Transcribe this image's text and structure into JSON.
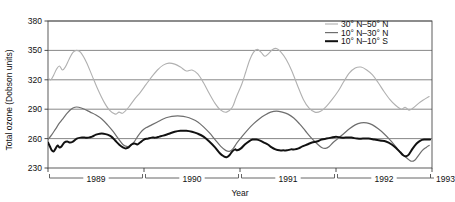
{
  "chart_data": {
    "type": "line",
    "title": "",
    "xlabel": "Year",
    "ylabel": "Total ozone (Dobson units)",
    "ylim": [
      230,
      380
    ],
    "xlim": [
      1989,
      1993
    ],
    "yticks": [
      230,
      260,
      290,
      320,
      350,
      380
    ],
    "xticks": [
      1989,
      1990,
      1991,
      1992,
      1993
    ],
    "xtick_labels": [
      "1989",
      "1990",
      "1991",
      "1992",
      "1993"
    ],
    "ytick_labels": [
      "230",
      "260",
      "290",
      "320",
      "350",
      "380"
    ],
    "grid": "horizontal",
    "legend_position": "top-right",
    "series": [
      {
        "name": "30° N–50° N",
        "color": "#b0b0b0",
        "width": 1.1,
        "points": [
          [
            1989.0,
            322
          ],
          [
            1989.03,
            320
          ],
          [
            1989.06,
            325
          ],
          [
            1989.09,
            331
          ],
          [
            1989.12,
            334
          ],
          [
            1989.15,
            330
          ],
          [
            1989.18,
            333
          ],
          [
            1989.22,
            341
          ],
          [
            1989.26,
            348
          ],
          [
            1989.3,
            350
          ],
          [
            1989.34,
            348
          ],
          [
            1989.4,
            338
          ],
          [
            1989.46,
            324
          ],
          [
            1989.52,
            310
          ],
          [
            1989.58,
            298
          ],
          [
            1989.64,
            289
          ],
          [
            1989.7,
            285
          ],
          [
            1989.74,
            287
          ],
          [
            1989.78,
            286
          ],
          [
            1989.84,
            292
          ],
          [
            1989.9,
            300
          ],
          [
            1989.96,
            307
          ],
          [
            1990.02,
            315
          ],
          [
            1990.08,
            323
          ],
          [
            1990.14,
            330
          ],
          [
            1990.2,
            335
          ],
          [
            1990.26,
            337
          ],
          [
            1990.32,
            336
          ],
          [
            1990.38,
            333
          ],
          [
            1990.44,
            329
          ],
          [
            1990.5,
            330
          ],
          [
            1990.56,
            326
          ],
          [
            1990.62,
            317
          ],
          [
            1990.68,
            306
          ],
          [
            1990.74,
            296
          ],
          [
            1990.8,
            289
          ],
          [
            1990.86,
            287
          ],
          [
            1990.92,
            292
          ],
          [
            1990.96,
            302
          ],
          [
            1991.02,
            316
          ],
          [
            1991.06,
            328
          ],
          [
            1991.1,
            340
          ],
          [
            1991.14,
            348
          ],
          [
            1991.18,
            351
          ],
          [
            1991.22,
            348
          ],
          [
            1991.26,
            344
          ],
          [
            1991.3,
            347
          ],
          [
            1991.34,
            351
          ],
          [
            1991.38,
            352
          ],
          [
            1991.42,
            349
          ],
          [
            1991.48,
            341
          ],
          [
            1991.54,
            329
          ],
          [
            1991.6,
            314
          ],
          [
            1991.66,
            300
          ],
          [
            1991.72,
            291
          ],
          [
            1991.78,
            287
          ],
          [
            1991.84,
            288
          ],
          [
            1991.9,
            293
          ],
          [
            1991.96,
            300
          ],
          [
            1992.02,
            308
          ],
          [
            1992.08,
            318
          ],
          [
            1992.14,
            327
          ],
          [
            1992.2,
            332
          ],
          [
            1992.26,
            333
          ],
          [
            1992.32,
            330
          ],
          [
            1992.38,
            325
          ],
          [
            1992.44,
            317
          ],
          [
            1992.5,
            308
          ],
          [
            1992.56,
            300
          ],
          [
            1992.62,
            294
          ],
          [
            1992.68,
            290
          ],
          [
            1992.72,
            292
          ],
          [
            1992.76,
            289
          ],
          [
            1992.8,
            291
          ],
          [
            1992.86,
            296
          ],
          [
            1992.92,
            300
          ],
          [
            1992.97,
            303
          ]
        ]
      },
      {
        "name": "10° N–30° N",
        "color": "#6e6e6e",
        "width": 1.2,
        "points": [
          [
            1989.0,
            259
          ],
          [
            1989.04,
            264
          ],
          [
            1989.08,
            270
          ],
          [
            1989.12,
            276
          ],
          [
            1989.16,
            281
          ],
          [
            1989.2,
            286
          ],
          [
            1989.24,
            290
          ],
          [
            1989.28,
            292
          ],
          [
            1989.32,
            292
          ],
          [
            1989.38,
            290
          ],
          [
            1989.44,
            287
          ],
          [
            1989.5,
            284
          ],
          [
            1989.56,
            280
          ],
          [
            1989.62,
            274
          ],
          [
            1989.68,
            267
          ],
          [
            1989.74,
            259
          ],
          [
            1989.78,
            254
          ],
          [
            1989.82,
            252
          ],
          [
            1989.86,
            253
          ],
          [
            1989.9,
            257
          ],
          [
            1989.94,
            263
          ],
          [
            1989.98,
            268
          ],
          [
            1990.02,
            271
          ],
          [
            1990.08,
            274
          ],
          [
            1990.14,
            277
          ],
          [
            1990.2,
            280
          ],
          [
            1990.26,
            282
          ],
          [
            1990.32,
            283
          ],
          [
            1990.38,
            283
          ],
          [
            1990.44,
            282
          ],
          [
            1990.5,
            280
          ],
          [
            1990.56,
            277
          ],
          [
            1990.62,
            272
          ],
          [
            1990.68,
            266
          ],
          [
            1990.74,
            259
          ],
          [
            1990.8,
            252
          ],
          [
            1990.85,
            248
          ],
          [
            1990.89,
            247
          ],
          [
            1990.93,
            250
          ],
          [
            1990.97,
            256
          ],
          [
            1991.02,
            262
          ],
          [
            1991.08,
            269
          ],
          [
            1991.14,
            275
          ],
          [
            1991.2,
            280
          ],
          [
            1991.26,
            284
          ],
          [
            1991.32,
            287
          ],
          [
            1991.38,
            288
          ],
          [
            1991.44,
            287
          ],
          [
            1991.5,
            285
          ],
          [
            1991.56,
            281
          ],
          [
            1991.62,
            275
          ],
          [
            1991.68,
            268
          ],
          [
            1991.74,
            261
          ],
          [
            1991.8,
            255
          ],
          [
            1991.85,
            251
          ],
          [
            1991.89,
            250
          ],
          [
            1991.93,
            252
          ],
          [
            1991.97,
            256
          ],
          [
            1992.02,
            260
          ],
          [
            1992.08,
            265
          ],
          [
            1992.14,
            270
          ],
          [
            1992.2,
            274
          ],
          [
            1992.26,
            276
          ],
          [
            1992.32,
            276
          ],
          [
            1992.38,
            274
          ],
          [
            1992.44,
            270
          ],
          [
            1992.5,
            265
          ],
          [
            1992.56,
            259
          ],
          [
            1992.62,
            252
          ],
          [
            1992.68,
            245
          ],
          [
            1992.74,
            240
          ],
          [
            1992.78,
            237
          ],
          [
            1992.82,
            238
          ],
          [
            1992.86,
            243
          ],
          [
            1992.9,
            248
          ],
          [
            1992.94,
            251
          ],
          [
            1992.97,
            253
          ]
        ]
      },
      {
        "name": "10° N–10° S",
        "color": "#111111",
        "width": 2.0,
        "points": [
          [
            1989.0,
            256
          ],
          [
            1989.02,
            252
          ],
          [
            1989.04,
            248
          ],
          [
            1989.06,
            247
          ],
          [
            1989.08,
            250
          ],
          [
            1989.1,
            253
          ],
          [
            1989.12,
            251
          ],
          [
            1989.14,
            252
          ],
          [
            1989.17,
            256
          ],
          [
            1989.2,
            257
          ],
          [
            1989.23,
            256
          ],
          [
            1989.26,
            257
          ],
          [
            1989.3,
            260
          ],
          [
            1989.34,
            261
          ],
          [
            1989.38,
            261
          ],
          [
            1989.42,
            261
          ],
          [
            1989.46,
            262
          ],
          [
            1989.5,
            264
          ],
          [
            1989.54,
            265
          ],
          [
            1989.58,
            265
          ],
          [
            1989.62,
            264
          ],
          [
            1989.66,
            262
          ],
          [
            1989.7,
            258
          ],
          [
            1989.74,
            254
          ],
          [
            1989.78,
            251
          ],
          [
            1989.81,
            250
          ],
          [
            1989.84,
            251
          ],
          [
            1989.87,
            254
          ],
          [
            1989.9,
            255
          ],
          [
            1989.93,
            254
          ],
          [
            1989.96,
            256
          ],
          [
            1990.0,
            259
          ],
          [
            1990.04,
            260
          ],
          [
            1990.08,
            261
          ],
          [
            1990.12,
            261
          ],
          [
            1990.16,
            262
          ],
          [
            1990.2,
            263
          ],
          [
            1990.26,
            265
          ],
          [
            1990.32,
            267
          ],
          [
            1990.38,
            268
          ],
          [
            1990.44,
            268
          ],
          [
            1990.5,
            267
          ],
          [
            1990.56,
            265
          ],
          [
            1990.62,
            262
          ],
          [
            1990.68,
            257
          ],
          [
            1990.74,
            251
          ],
          [
            1990.79,
            245
          ],
          [
            1990.83,
            242
          ],
          [
            1990.86,
            241
          ],
          [
            1990.89,
            243
          ],
          [
            1990.92,
            247
          ],
          [
            1990.95,
            249
          ],
          [
            1990.97,
            248
          ],
          [
            1991.01,
            250
          ],
          [
            1991.05,
            254
          ],
          [
            1991.09,
            257
          ],
          [
            1991.13,
            259
          ],
          [
            1991.17,
            259
          ],
          [
            1991.21,
            258
          ],
          [
            1991.25,
            256
          ],
          [
            1991.29,
            254
          ],
          [
            1991.33,
            251
          ],
          [
            1991.37,
            249
          ],
          [
            1991.41,
            248
          ],
          [
            1991.45,
            248
          ],
          [
            1991.49,
            248
          ],
          [
            1991.53,
            249
          ],
          [
            1991.57,
            249
          ],
          [
            1991.61,
            250
          ],
          [
            1991.65,
            252
          ],
          [
            1991.7,
            254
          ],
          [
            1991.75,
            256
          ],
          [
            1991.8,
            257
          ],
          [
            1991.85,
            259
          ],
          [
            1991.9,
            260
          ],
          [
            1991.95,
            261
          ],
          [
            1992.0,
            262
          ],
          [
            1992.05,
            261
          ],
          [
            1992.1,
            261
          ],
          [
            1992.16,
            261
          ],
          [
            1992.22,
            260
          ],
          [
            1992.28,
            260
          ],
          [
            1992.34,
            260
          ],
          [
            1992.4,
            259
          ],
          [
            1992.46,
            258
          ],
          [
            1992.52,
            257
          ],
          [
            1992.58,
            254
          ],
          [
            1992.63,
            250
          ],
          [
            1992.67,
            246
          ],
          [
            1992.7,
            243
          ],
          [
            1992.73,
            242
          ],
          [
            1992.76,
            244
          ],
          [
            1992.8,
            250
          ],
          [
            1992.84,
            255
          ],
          [
            1992.88,
            258
          ],
          [
            1992.92,
            259
          ],
          [
            1992.95,
            259
          ],
          [
            1992.98,
            259
          ]
        ]
      }
    ]
  }
}
